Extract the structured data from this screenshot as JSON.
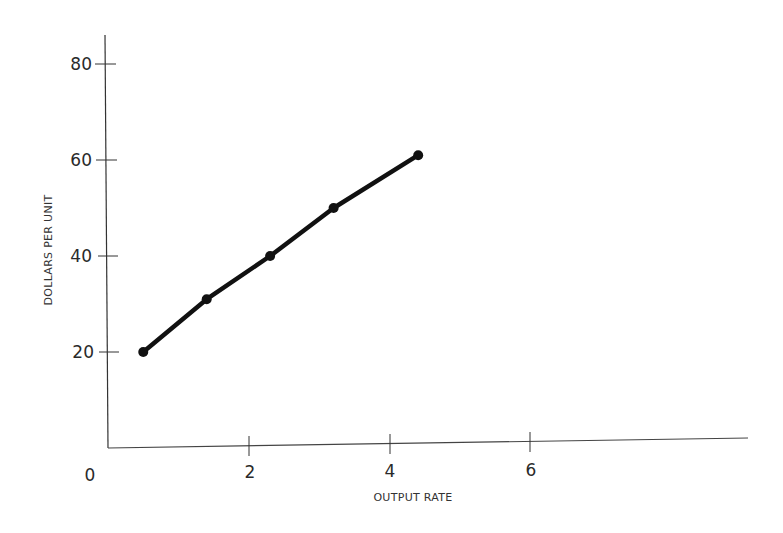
{
  "chart_data": {
    "type": "line",
    "title": "",
    "xlabel": "OUTPUT RATE",
    "ylabel": "DOLLARS PER UNIT",
    "x_ticks": [
      "2",
      "4",
      "6"
    ],
    "y_ticks": [
      "20",
      "40",
      "60",
      "80"
    ],
    "origin_label": "0",
    "xlim": [
      0,
      9
    ],
    "ylim": [
      0,
      85
    ],
    "grid": false,
    "legend": null,
    "series": [
      {
        "name": "cost curve",
        "x": [
          0.5,
          1.4,
          2.3,
          3.2,
          4.4
        ],
        "y": [
          20,
          31,
          40,
          50,
          61
        ],
        "color": "#111111",
        "markers": true
      }
    ]
  }
}
